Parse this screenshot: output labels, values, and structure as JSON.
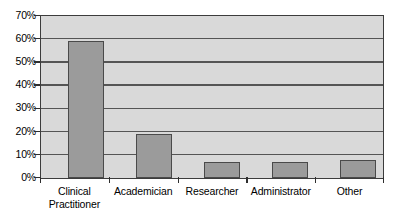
{
  "chart_data": {
    "type": "bar",
    "title": "",
    "subtitle": "",
    "xlabel": "",
    "ylabel": "",
    "categories": [
      "Clinical Practitioner",
      "Academician",
      "Researcher",
      "Administrator",
      "Other"
    ],
    "values": [
      59,
      19,
      7,
      7,
      8
    ],
    "ylim": [
      0,
      70
    ],
    "ytick_values": [
      0,
      10,
      20,
      30,
      40,
      50,
      60,
      70
    ],
    "ytick_labels": [
      "0%",
      "10%",
      "20%",
      "30%",
      "40%",
      "50%",
      "60%",
      "70%"
    ],
    "grid": true,
    "legend": false,
    "legend_position": "none",
    "annotations": [],
    "colors": {
      "bar_fill": "#9b9b9b",
      "bar_border": "#4a4a4a",
      "plot_background": "#d9d9d9",
      "gridline": "#555555",
      "axis_line": "#3c3c3c",
      "text": "#000000",
      "page_background": "#ffffff"
    }
  },
  "axis": {
    "y_labels": [
      {
        "text": "70%",
        "value": 70
      },
      {
        "text": "60%",
        "value": 60
      },
      {
        "text": "50%",
        "value": 50
      },
      {
        "text": "40%",
        "value": 40
      },
      {
        "text": "30%",
        "value": 30
      },
      {
        "text": "20%",
        "value": 20
      },
      {
        "text": "10%",
        "value": 10
      },
      {
        "text": "0%",
        "value": 0
      }
    ],
    "x_labels": [
      {
        "line1": "Clinical",
        "line2": "Practitioner"
      },
      {
        "line1": "Academician",
        "line2": ""
      },
      {
        "line1": "Researcher",
        "line2": ""
      },
      {
        "line1": "Administrator",
        "line2": ""
      },
      {
        "line1": "Other",
        "line2": ""
      }
    ]
  }
}
